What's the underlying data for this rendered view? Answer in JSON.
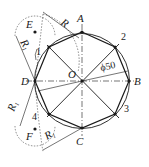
{
  "diagram": {
    "center_label": "O",
    "points": {
      "A": "A",
      "B": "B",
      "C": "C",
      "D": "D",
      "E": "E",
      "F": "F",
      "p1": "1",
      "p2": "2",
      "p3": "3",
      "p4": "4"
    },
    "dimension": {
      "diameter": "ϕ50"
    },
    "radii": {
      "R": "R",
      "R1": "R",
      "R1_sub": "1"
    },
    "colors": {
      "line": "#1a1a1a",
      "background": "#ffffff"
    }
  }
}
